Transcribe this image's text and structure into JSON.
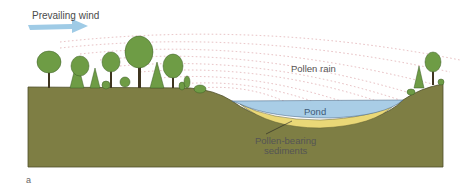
{
  "figure": {
    "panel_letter": "a",
    "labels": {
      "wind": "Prevailing wind",
      "pollen_rain": "Pollen rain",
      "pond": "Pond",
      "sediments_line1": "Pollen-bearing",
      "sediments_line2": "sediments"
    },
    "colors": {
      "ground": "#7e7e44",
      "ground_edge": "#4f4f2a",
      "water": "#a9cde6",
      "sediment": "#ead877",
      "pollen_dots": "#d99aa0",
      "wind_arrow": "#9fcbe6",
      "tree_foliage": "#6e9c45",
      "tree_trunk": "#3f3520"
    }
  }
}
